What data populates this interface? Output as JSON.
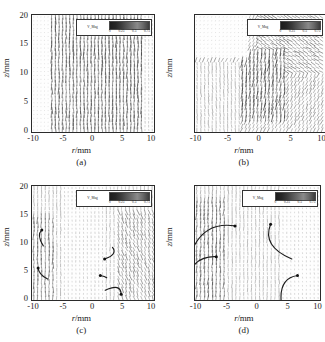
{
  "figure": {
    "type": "vector-field-panel-grid",
    "panels": [
      {
        "caption": "(a)",
        "xlabel_var": "r",
        "xlabel_unit": "/mm",
        "ylabel_var": "z",
        "ylabel_unit": "/mm",
        "xticks": [
          "-10",
          "-5",
          "0",
          "5",
          "10"
        ],
        "yticks": [
          "0",
          "5",
          "10",
          "15",
          "20"
        ],
        "legend": {
          "title": "V_Mag",
          "ticks": [
            "0",
            "0.25",
            "0.5",
            "0.75"
          ],
          "units": "m/s"
        }
      },
      {
        "caption": "(b)",
        "xlabel_var": "r",
        "xlabel_unit": "/mm",
        "ylabel_var": "z",
        "ylabel_unit": "/mm",
        "xticks": [
          "-10",
          "-5",
          "0",
          "5",
          "10"
        ],
        "yticks": [
          "0",
          "5",
          "10",
          "15",
          "20"
        ],
        "legend": {
          "title": "V_Mag",
          "ticks": [
            "0",
            "0.25",
            "0.5",
            "0.75"
          ],
          "units": "m/s"
        }
      },
      {
        "caption": "(c)",
        "xlabel_var": "r",
        "xlabel_unit": "/mm",
        "ylabel_var": "z",
        "ylabel_unit": "/mm",
        "xticks": [
          "-10",
          "-5",
          "0",
          "5",
          "10"
        ],
        "yticks": [
          "0",
          "5",
          "10",
          "15",
          "20"
        ],
        "legend": {
          "title": "V_Mag",
          "ticks": [
            "0",
            "0.25",
            "0.5",
            "0.75"
          ],
          "units": "m/s"
        }
      },
      {
        "caption": "(d)",
        "xlabel_var": "r",
        "xlabel_unit": "/mm",
        "ylabel_var": "z",
        "ylabel_unit": "/mm",
        "xticks": [
          "-10",
          "-5",
          "0",
          "5",
          "10"
        ],
        "yticks": [
          "0",
          "5",
          "10",
          "15",
          "20"
        ],
        "legend": {
          "title": "V_Mag",
          "ticks": [
            "0",
            "0.25",
            "0.5",
            "0.75"
          ],
          "units": "m/s"
        }
      }
    ]
  },
  "chart_data": [
    {
      "type": "scatter",
      "subtype": "vector-field-quiver",
      "title": "(a)",
      "xlabel": "r/mm",
      "ylabel": "z/mm",
      "xlim": [
        -10,
        10
      ],
      "ylim": [
        0,
        20
      ],
      "xticks": [
        -10,
        -5,
        0,
        5,
        10
      ],
      "yticks": [
        0,
        5,
        10,
        15,
        20
      ],
      "grid": false,
      "legend": {
        "label": "V_Mag",
        "range": [
          0,
          0.75
        ],
        "units": "m/s",
        "position": "inset-top-right",
        "colormap": "grayscale"
      },
      "field": {
        "description": "Dense near-vertical upward vectors spanning the full domain; largest magnitudes in a broad central-to-right column, weak disordered vectors along the far left edge below z=15.",
        "nx": 34,
        "nz": 30,
        "dominant_direction_deg": 90,
        "mean_magnitude": 0.42,
        "max_magnitude": 0.75,
        "regions": [
          {
            "name": "left-weak-zone",
            "r_range": [
              -10,
              -7
            ],
            "z_range": [
              0,
              20
            ],
            "magnitude": 0.08,
            "angle_deg": 95
          },
          {
            "name": "central-jet",
            "r_range": [
              -7,
              8
            ],
            "z_range": [
              0,
              20
            ],
            "magnitude": 0.58,
            "angle_deg": 90
          },
          {
            "name": "right-edge",
            "r_range": [
              8,
              10
            ],
            "z_range": [
              0,
              20
            ],
            "magnitude": 0.22,
            "angle_deg": 88
          }
        ]
      }
    },
    {
      "type": "scatter",
      "subtype": "vector-field-quiver",
      "title": "(b)",
      "xlabel": "r/mm",
      "ylabel": "z/mm",
      "xlim": [
        -10,
        10
      ],
      "ylim": [
        0,
        20
      ],
      "xticks": [
        -10,
        -5,
        0,
        5,
        10
      ],
      "yticks": [
        0,
        5,
        10,
        15,
        20
      ],
      "grid": false,
      "legend": {
        "label": "V_Mag",
        "range": [
          0,
          0.75
        ],
        "units": "m/s",
        "position": "inset-top-right",
        "colormap": "grayscale"
      },
      "field": {
        "description": "Strong diagonal convergence: vectors in the upper-right tilt down-left toward r=0, lower-left region flows upward, forming a shear layer running from upper-right to lower-centre.",
        "nx": 34,
        "nz": 30,
        "dominant_direction_deg": 115,
        "mean_magnitude": 0.47,
        "max_magnitude": 0.78,
        "regions": [
          {
            "name": "upper-right-inflow",
            "r_range": [
              0,
              10
            ],
            "z_range": [
              10,
              20
            ],
            "magnitude": 0.55,
            "angle_deg": 210
          },
          {
            "name": "shear-layer",
            "r_range": [
              -3,
              4
            ],
            "z_range": [
              2,
              14
            ],
            "magnitude": 0.66,
            "angle_deg": 100
          },
          {
            "name": "lower-left-upflow",
            "r_range": [
              -10,
              -3
            ],
            "z_range": [
              0,
              12
            ],
            "magnitude": 0.35,
            "angle_deg": 85
          },
          {
            "name": "upper-left-sparse",
            "r_range": [
              -10,
              -2
            ],
            "z_range": [
              13,
              20
            ],
            "magnitude": 0.1,
            "angle_deg": 160
          }
        ]
      }
    },
    {
      "type": "scatter",
      "subtype": "vector-field-quiver",
      "title": "(c)",
      "xlabel": "r/mm",
      "ylabel": "z/mm",
      "xlim": [
        -10,
        10
      ],
      "ylim": [
        0,
        20
      ],
      "xticks": [
        -10,
        -5,
        0,
        5,
        10
      ],
      "yticks": [
        0,
        5,
        10,
        15,
        20
      ],
      "grid": false,
      "legend": {
        "label": "V_Mag",
        "range": [
          0,
          0.75
        ],
        "units": "m/s",
        "position": "inset-top-right",
        "colormap": "grayscale"
      },
      "field": {
        "description": "Moderately dense upward field with several curved recirculation streamlines annotated; vortex centres marked with filled dots.",
        "nx": 32,
        "nz": 28,
        "dominant_direction_deg": 90,
        "mean_magnitude": 0.3,
        "max_magnitude": 0.7,
        "regions": [
          {
            "name": "left-column",
            "r_range": [
              -10,
              -6
            ],
            "z_range": [
              0,
              15
            ],
            "magnitude": 0.48,
            "angle_deg": 92
          },
          {
            "name": "centre-weak",
            "r_range": [
              -5,
              2
            ],
            "z_range": [
              0,
              20
            ],
            "magnitude": 0.18,
            "angle_deg": 88
          },
          {
            "name": "right-diagonal",
            "r_range": [
              4,
              10
            ],
            "z_range": [
              0,
              16
            ],
            "magnitude": 0.45,
            "angle_deg": 70
          }
        ]
      },
      "annotations": [
        {
          "kind": "streamline-arc",
          "label": "vortex-upper-left",
          "center_r": -8.3,
          "center_z": 11.5,
          "marker_r": -8.4,
          "marker_z": 12.3
        },
        {
          "kind": "streamline-arc",
          "label": "vortex-lower-left",
          "center_r": -8.4,
          "center_z": 5.2,
          "marker_r": -9.0,
          "marker_z": 5.6
        },
        {
          "kind": "streamline-arc",
          "label": "vortex-mid-right",
          "center_r": 2.4,
          "center_z": 8.6,
          "marker_r": 1.9,
          "marker_z": 7.2
        },
        {
          "kind": "streamline-arc",
          "label": "vortex-centre",
          "center_r": 1.6,
          "center_z": 4.6,
          "marker_r": 1.2,
          "marker_z": 4.3
        },
        {
          "kind": "streamline-arc",
          "label": "vortex-lower-right",
          "center_r": 3.6,
          "center_z": 1.8,
          "marker_r": 4.6,
          "marker_z": 1.0
        }
      ]
    },
    {
      "type": "scatter",
      "subtype": "vector-field-quiver",
      "title": "(d)",
      "xlabel": "r/mm",
      "ylabel": "z/mm",
      "xlim": [
        -10,
        10
      ],
      "ylim": [
        0,
        20
      ],
      "xticks": [
        -10,
        -5,
        0,
        5,
        10
      ],
      "yticks": [
        0,
        5,
        10,
        15,
        20
      ],
      "grid": false,
      "legend": {
        "label": "V_Mag",
        "range": [
          0,
          0.75
        ],
        "units": "m/s",
        "position": "inset-top-right",
        "colormap": "grayscale"
      },
      "field": {
        "description": "Predominantly vertical field with a strong left-hand band; three long curved streamline arcs with arrowheads mark rising and recirculating paths.",
        "nx": 32,
        "nz": 28,
        "dominant_direction_deg": 90,
        "mean_magnitude": 0.33,
        "max_magnitude": 0.72,
        "regions": [
          {
            "name": "left-band",
            "r_range": [
              -10,
              -5
            ],
            "z_range": [
              0,
              18
            ],
            "magnitude": 0.52,
            "angle_deg": 95
          },
          {
            "name": "centre-column",
            "r_range": [
              -4,
              3
            ],
            "z_range": [
              0,
              20
            ],
            "magnitude": 0.3,
            "angle_deg": 90
          },
          {
            "name": "right-weak",
            "r_range": [
              4,
              10
            ],
            "z_range": [
              0,
              20
            ],
            "magnitude": 0.16,
            "angle_deg": 85
          }
        ]
      },
      "annotations": [
        {
          "kind": "streamline-arc",
          "label": "rising-plume-left",
          "center_r": -6.5,
          "center_z": 10.5,
          "marker_r": -3.6,
          "marker_z": 13.0
        },
        {
          "kind": "streamline-arc",
          "label": "rising-plume-lower-left",
          "center_r": -8.5,
          "center_z": 5.5,
          "marker_r": -6.6,
          "marker_z": 7.6
        },
        {
          "kind": "streamline-arc",
          "label": "recirculation-right",
          "center_r": 3.4,
          "center_z": 11.0,
          "marker_r": 2.1,
          "marker_z": 13.3
        },
        {
          "kind": "streamline-arc",
          "label": "hook-lower-right",
          "center_r": 5.4,
          "center_z": 2.6,
          "marker_r": 6.4,
          "marker_z": 4.3
        }
      ]
    }
  ]
}
